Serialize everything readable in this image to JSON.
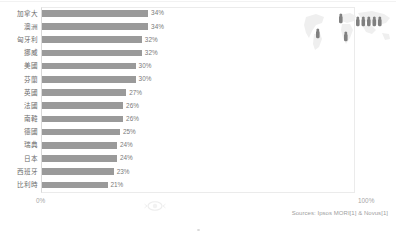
{
  "chart_data": {
    "type": "bar",
    "title": "",
    "subtitle": "",
    "xlabel": "",
    "ylabel": "",
    "orientation": "horizontal",
    "grid": false,
    "legend": "none",
    "xlim": [
      0,
      100
    ],
    "axis_ticks": [
      "0%",
      "100%"
    ],
    "value_suffix": "%",
    "bar_color": "#9a9a9a",
    "categories": [
      "加拿大",
      "澳洲",
      "匈牙利",
      "挪威",
      "美國",
      "芬蘭",
      "英國",
      "法國",
      "南韓",
      "德國",
      "瑞典",
      "日本",
      "西班牙",
      "比利時"
    ],
    "values": [
      34,
      34,
      32,
      32,
      30,
      30,
      27,
      26,
      26,
      25,
      24,
      24,
      23,
      21
    ],
    "value_labels": [
      "34%",
      "34%",
      "32%",
      "32%",
      "30%",
      "30%",
      "27%",
      "26%",
      "26%",
      "25%",
      "24%",
      "24%",
      "23%",
      "21%"
    ],
    "annotations": [
      "Sources: Ipsos MORI[1] & Novus[1]"
    ]
  },
  "axis": {
    "min_label": "0%",
    "max_label": "100%"
  },
  "footer": {
    "source_text": "Sources: Ipsos MORI[1] & Novus[1]"
  },
  "map": {
    "name": "world-map-graphic",
    "marker_count": 8,
    "map_fill": "#efefef",
    "marker_fill": "#808080"
  },
  "colors": {
    "bar": "#9a9a9a",
    "label_text": "#6b6b6b",
    "value_text": "#7a7a7a",
    "axis_text": "#a6a6a6",
    "frame": "#ebebeb",
    "background": "#ffffff"
  }
}
